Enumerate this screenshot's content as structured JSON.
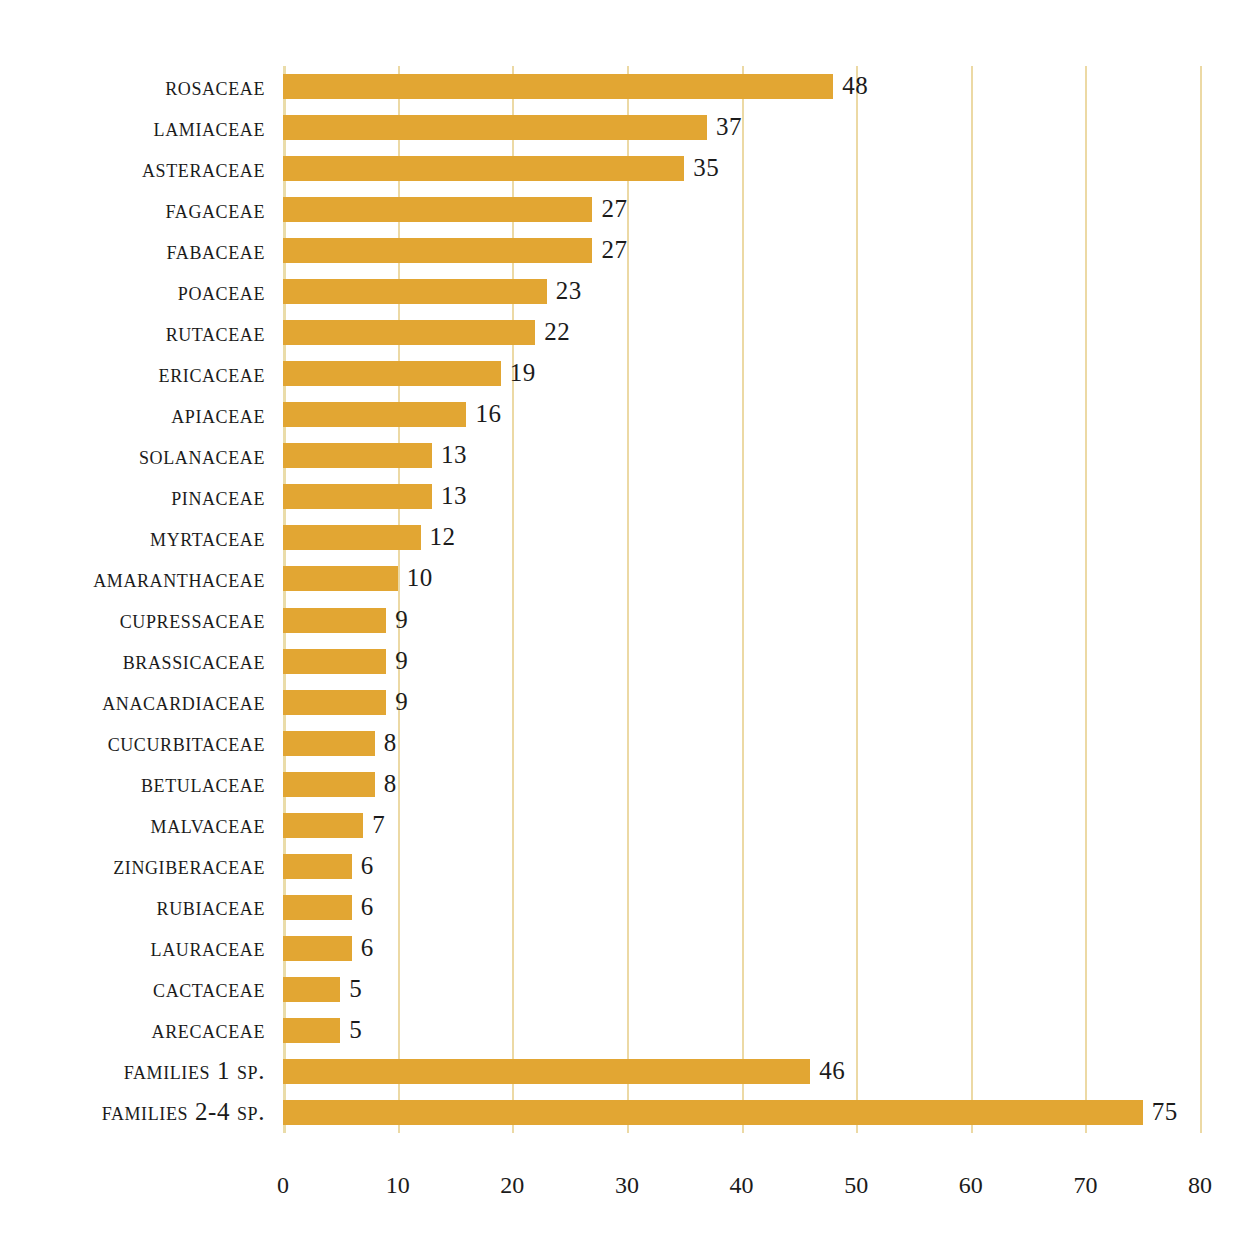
{
  "chart_data": {
    "type": "bar",
    "orientation": "horizontal",
    "title": "",
    "subtitle": "",
    "xlabel": "",
    "ylabel": "",
    "xlim": [
      0,
      80
    ],
    "xticks": [
      "0",
      "10",
      "20",
      "30",
      "40",
      "50",
      "60",
      "70",
      "80"
    ],
    "xtick_values": [
      0,
      10,
      20,
      30,
      40,
      50,
      60,
      70,
      80
    ],
    "grid": "vertical",
    "legend": "none",
    "bar_color": "#e2a633",
    "gridline_color": "#ecd9a4",
    "background_color": "#ffffff",
    "text_color": "#1b1b1b",
    "categories": [
      "Rosaceae",
      "Lamiaceae",
      "Asteraceae",
      "Fagaceae",
      "Fabaceae",
      "Poaceae",
      "Rutaceae",
      "Ericaceae",
      "Apiaceae",
      "Solanaceae",
      "Pinaceae",
      "Myrtaceae",
      "Amaranthaceae",
      "Cupressaceae",
      "Brassicaceae",
      "Anacardiaceae",
      "Cucurbitaceae",
      "Betulaceae",
      "Malvaceae",
      "Zingiberaceae",
      "Rubiaceae",
      "Lauraceae",
      "Cactaceae",
      "Arecaceae",
      "Families 1 Sp.",
      "Families 2-4 Sp."
    ],
    "values": [
      48,
      37,
      35,
      27,
      27,
      23,
      22,
      19,
      16,
      13,
      13,
      12,
      10,
      9,
      9,
      9,
      8,
      8,
      7,
      6,
      6,
      6,
      5,
      5,
      46,
      75
    ],
    "data_labels": [
      "48",
      "37",
      "35",
      "27",
      "27",
      "23",
      "22",
      "19",
      "16",
      "13",
      "13",
      "12",
      "10",
      "9",
      "9",
      "9",
      "8",
      "8",
      "7",
      "6",
      "6",
      "6",
      "5",
      "5",
      "46",
      "75"
    ]
  }
}
